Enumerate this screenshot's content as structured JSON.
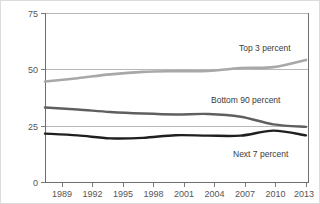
{
  "chart_data": {
    "type": "line",
    "title": "",
    "subtitle": "",
    "xlabel": "",
    "ylabel": "",
    "xlim": [
      1989,
      2013
    ],
    "ylim": [
      0,
      75
    ],
    "grid": true,
    "legend_position": "inline-right",
    "x": [
      1989,
      1992,
      1995,
      1998,
      2001,
      2004,
      2007,
      2010,
      2013
    ],
    "xtick_labels": [
      "1989",
      "1992",
      "1995",
      "1998",
      "2001",
      "2004",
      "2007",
      "2010",
      "2013"
    ],
    "ytick_labels": [
      "0",
      "25",
      "50",
      "75"
    ],
    "yticks": [
      0,
      25,
      50,
      75
    ],
    "series": [
      {
        "name": "Top 3 percent",
        "color": "#a8a8a8",
        "values": [
          44.8,
          46.3,
          48.0,
          49.1,
          49.4,
          49.5,
          50.8,
          51.2,
          54.4
        ],
        "label_text": "Top 3 percent"
      },
      {
        "name": "Bottom 90 percent",
        "color": "#5f5f5f",
        "values": [
          33.3,
          32.4,
          31.3,
          30.6,
          30.2,
          30.4,
          29.2,
          25.8,
          24.7
        ],
        "label_text": "Bottom 90 percent"
      },
      {
        "name": "Next 7 percent",
        "color": "#1f1f1f",
        "values": [
          21.7,
          20.9,
          19.6,
          19.8,
          21.0,
          20.8,
          20.8,
          23.0,
          20.9
        ],
        "label_text": "Next 7 percent"
      }
    ],
    "annotations": [
      {
        "text": "Top 3 percent",
        "x": 2009.0,
        "y": 58.5
      },
      {
        "text": "Bottom 90 percent",
        "x": 2006.4,
        "y": 34.8
      },
      {
        "text": "Next 7 percent",
        "x": 2008.6,
        "y": 14.2
      }
    ]
  }
}
